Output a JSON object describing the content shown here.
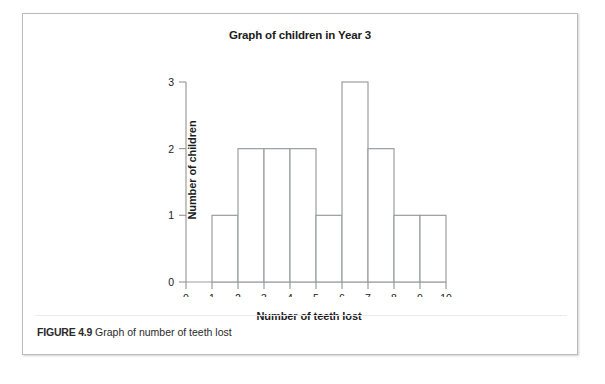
{
  "figure": {
    "caption_label": "FIGURE 4.9",
    "caption_text": "Graph of number of teeth lost"
  },
  "chart_data": {
    "type": "bar",
    "title": "Graph of children in Year 3",
    "xlabel": "Number of teeth lost",
    "ylabel": "Number of children",
    "categories": [
      "0-1",
      "1-2",
      "2-3",
      "3-4",
      "4-5",
      "5-6",
      "6-7",
      "7-8",
      "8-9",
      "9-10"
    ],
    "bin_edges": [
      0,
      1,
      2,
      3,
      4,
      5,
      6,
      7,
      8,
      9,
      10
    ],
    "values": [
      0,
      1,
      2,
      2,
      2,
      1,
      3,
      2,
      1,
      1
    ],
    "xlim": [
      0,
      10
    ],
    "ylim": [
      0,
      3
    ],
    "xticks": [
      "0",
      "1",
      "2",
      "3",
      "4",
      "5",
      "6",
      "7",
      "8",
      "9",
      "10"
    ],
    "yticks": [
      "0",
      "1",
      "2",
      "3"
    ],
    "grid": false,
    "legend": null,
    "bar_style": "outlined",
    "bar_fill": "#ffffff",
    "bar_stroke": "#9a9da0",
    "axis_color": "#9a9da0"
  }
}
